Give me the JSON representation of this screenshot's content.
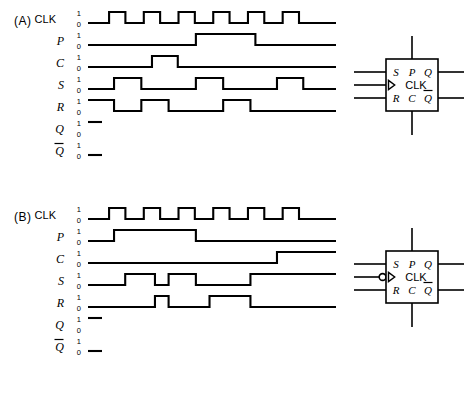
{
  "figure": {
    "type": "timing-diagram",
    "colors": {
      "ink": "#000000",
      "paper": "#ffffff"
    }
  },
  "sections": [
    {
      "id": "A",
      "label": "(A)",
      "signals": [
        {
          "name": "CLK",
          "style": "sans",
          "level_high": "1",
          "level_low": "0",
          "waveform": "pulse-train",
          "edges": [
            0,
            0,
            1,
            1,
            0,
            0,
            1,
            1,
            0,
            0,
            1,
            1,
            0,
            0,
            1,
            1,
            0,
            0,
            1,
            1,
            0,
            0,
            1,
            1,
            0,
            0
          ],
          "pulse_count": 6,
          "start_level": 0,
          "dashed_only": false
        },
        {
          "name": "P",
          "style": "italic",
          "level_high": "1",
          "level_low": "0",
          "waveform": "single-pulse",
          "start_level": 0,
          "transitions": [
            [
              0.435,
              1
            ],
            [
              0.675,
              0
            ]
          ],
          "dashed_only": false
        },
        {
          "name": "C",
          "style": "italic",
          "level_high": "1",
          "level_low": "0",
          "waveform": "single-pulse",
          "start_level": 0,
          "transitions": [
            [
              0.258,
              1
            ],
            [
              0.362,
              0
            ]
          ],
          "dashed_only": false
        },
        {
          "name": "S",
          "style": "italic",
          "level_high": "1",
          "level_low": "0",
          "waveform": "three-pulse",
          "start_level": 0,
          "transitions": [
            [
              0.105,
              1
            ],
            [
              0.215,
              0
            ],
            [
              0.435,
              1
            ],
            [
              0.545,
              0
            ],
            [
              0.762,
              1
            ],
            [
              0.868,
              0
            ]
          ],
          "dashed_only": false
        },
        {
          "name": "R",
          "style": "italic",
          "level_high": "1",
          "level_low": "0",
          "waveform": "three-pulse-high-start",
          "start_level": 1,
          "transitions": [
            [
              0.105,
              0
            ],
            [
              0.215,
              1
            ],
            [
              0.325,
              0
            ],
            [
              0.545,
              1
            ],
            [
              0.655,
              0
            ]
          ],
          "dashed_only": false
        },
        {
          "name": "Q",
          "style": "italic",
          "level_high": "1",
          "level_low": "0",
          "waveform": "blank",
          "start_level": 1,
          "transitions": [],
          "dashed_only": true
        },
        {
          "name": "Q̅",
          "style": "italic-overbar",
          "level_high": "1",
          "level_low": "0",
          "waveform": "blank",
          "start_level": 0,
          "transitions": [],
          "dashed_only": true
        }
      ],
      "flipflop": {
        "pins_top": [
          "S",
          "P",
          "Q"
        ],
        "pin_clk": "CLK",
        "pins_bottom": [
          "R",
          "C",
          "Q̅"
        ],
        "clock_trigger": "positive-edge",
        "has_inversion_bubble": false
      }
    },
    {
      "id": "B",
      "label": "(B)",
      "signals": [
        {
          "name": "CLK",
          "style": "sans",
          "level_high": "1",
          "level_low": "0",
          "waveform": "pulse-train",
          "pulse_count": 6,
          "start_level": 0,
          "dashed_only": false
        },
        {
          "name": "P",
          "style": "italic",
          "level_high": "1",
          "level_low": "0",
          "waveform": "single-pulse",
          "start_level": 0,
          "transitions": [
            [
              0.105,
              1
            ],
            [
              0.435,
              0
            ]
          ],
          "dashed_only": false
        },
        {
          "name": "C",
          "style": "italic",
          "level_high": "1",
          "level_low": "0",
          "waveform": "step-up",
          "start_level": 0,
          "transitions": [
            [
              0.762,
              1
            ]
          ],
          "dashed_only": false
        },
        {
          "name": "S",
          "style": "italic",
          "level_high": "1",
          "level_low": "0",
          "waveform": "multi-pulse",
          "start_level": 0,
          "transitions": [
            [
              0.15,
              1
            ],
            [
              0.27,
              0
            ],
            [
              0.325,
              1
            ],
            [
              0.435,
              0
            ],
            [
              0.655,
              1
            ]
          ],
          "dashed_only": false
        },
        {
          "name": "R",
          "style": "italic",
          "level_high": "1",
          "level_low": "0",
          "waveform": "multi-pulse",
          "start_level": 0,
          "transitions": [
            [
              0.27,
              1
            ],
            [
              0.325,
              0
            ],
            [
              0.49,
              1
            ],
            [
              0.655,
              0
            ]
          ],
          "dashed_only": false
        },
        {
          "name": "Q",
          "style": "italic",
          "level_high": "1",
          "level_low": "0",
          "waveform": "blank",
          "start_level": 1,
          "transitions": [],
          "dashed_only": true
        },
        {
          "name": "Q̅",
          "style": "italic-overbar",
          "level_high": "1",
          "level_low": "0",
          "waveform": "blank",
          "start_level": 0,
          "transitions": [],
          "dashed_only": true
        }
      ],
      "flipflop": {
        "pins_top": [
          "S",
          "P",
          "Q"
        ],
        "pin_clk": "CLK",
        "pins_bottom": [
          "R",
          "C",
          "Q̅"
        ],
        "clock_trigger": "negative-edge",
        "has_inversion_bubble": true
      }
    }
  ]
}
